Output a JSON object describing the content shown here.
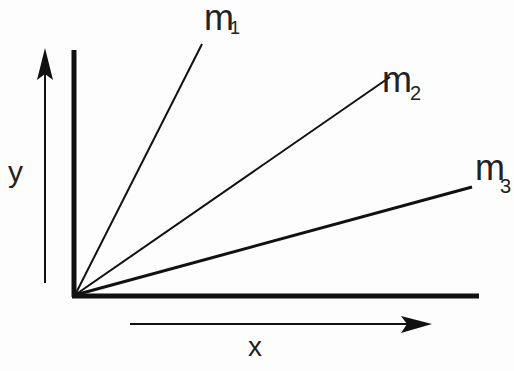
{
  "diagram": {
    "title": "",
    "axes": {
      "x_label": "x",
      "y_label": "y"
    },
    "lines": [
      {
        "name": "m",
        "subscript": "1"
      },
      {
        "name": "m",
        "subscript": "2"
      },
      {
        "name": "m",
        "subscript": "3"
      }
    ],
    "colors": {
      "ink": "#111111",
      "background": "#fdfdfd"
    }
  }
}
